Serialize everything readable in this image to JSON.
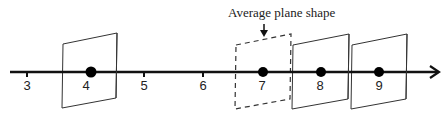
{
  "diagram": {
    "caption": "Average plane shape",
    "axis": {
      "direction": "right",
      "ticks": [
        "3",
        "4",
        "5",
        "6",
        "7",
        "8",
        "9"
      ]
    },
    "points": [
      {
        "label": "4",
        "has_plane": true,
        "plane_style": "solid"
      },
      {
        "label": "7",
        "has_plane": true,
        "plane_style": "dashed"
      },
      {
        "label": "8",
        "has_plane": true,
        "plane_style": "solid"
      },
      {
        "label": "9",
        "has_plane": true,
        "plane_style": "solid"
      }
    ],
    "colors": {
      "line": "#111111",
      "dot": "#000000",
      "plane_stroke": "#333333",
      "text": "#222222"
    }
  }
}
